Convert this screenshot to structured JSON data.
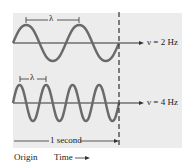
{
  "diagram": {
    "top_wave": {
      "frequency_label": "ν = 2 Hz",
      "wavelength_label": "λ",
      "cycles": 2
    },
    "bottom_wave": {
      "frequency_label": "ν = 4 Hz",
      "wavelength_label": "λ",
      "cycles": 4
    },
    "duration_label": "1 second",
    "origin_label": "Origin",
    "time_label": "Time",
    "colors": {
      "wave": "#6a6a6a",
      "panel": "#ececec",
      "axis": "#333333"
    }
  }
}
